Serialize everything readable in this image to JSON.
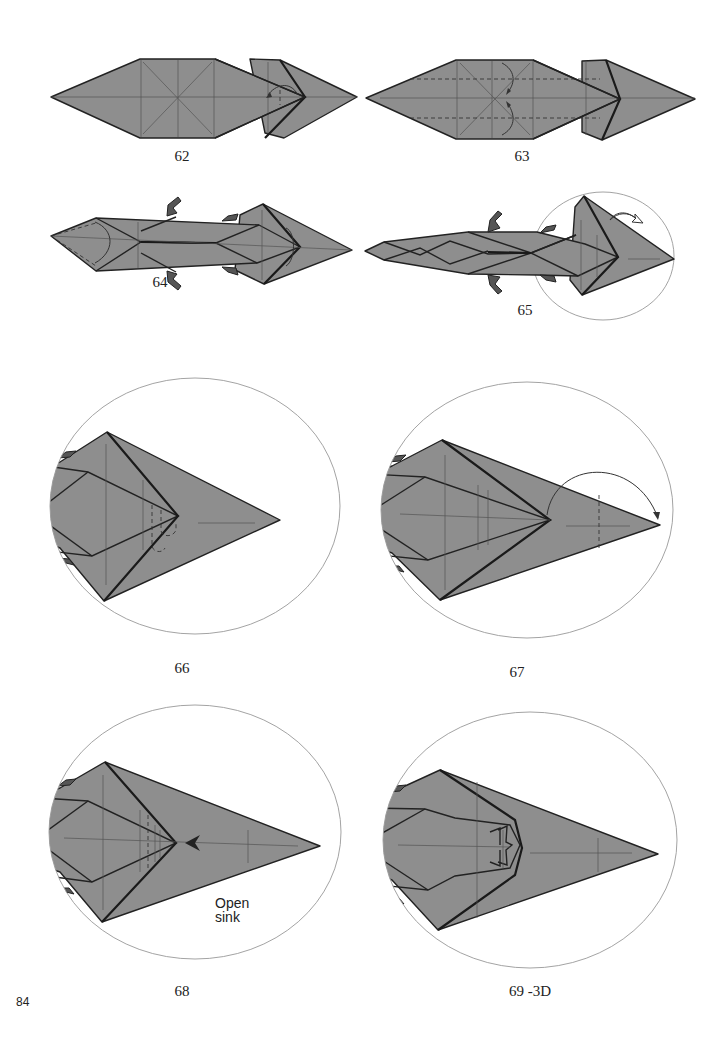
{
  "page": {
    "page_number": "84",
    "paper_color": "#8e8e8e",
    "line_color": "#222222"
  },
  "steps": [
    {
      "number": "62",
      "description": "Fold the inner flap to the left along the head"
    },
    {
      "number": "63",
      "description": "Valley fold edges to the center crease (dashed lines) with arrows"
    },
    {
      "number": "64",
      "description": "Body narrowed with legs formed; rotate/turn at tail and head"
    },
    {
      "number": "65",
      "description": "Tail narrowed; head region enlarged in circle",
      "icon": "turn-over-icon"
    },
    {
      "number": "66",
      "description": "Close-up of head; crease lines at neck"
    },
    {
      "number": "67",
      "description": "Close-up of head; fold tip over with arrow to dashed line"
    },
    {
      "number": "68",
      "description": "Close-up of head; open sink at arrow",
      "note": {
        "line1": "Open",
        "line2": "sink"
      }
    },
    {
      "number": "69 -3D",
      "description": "Close-up of head after open sink, 3D view"
    }
  ]
}
